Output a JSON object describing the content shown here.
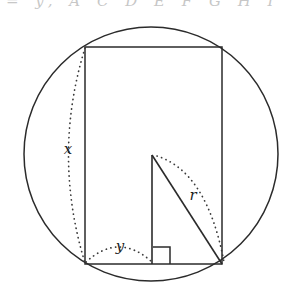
{
  "figure": {
    "caption_fragment": "= y, A C D E F G H I",
    "stroke_color": "#2b2b2b",
    "dotted_color": "#3a3a3a",
    "background_color": "#ffffff",
    "labels": [
      {
        "id": "x",
        "text": "x",
        "x": 68,
        "y": 149,
        "meaning": "rectangle-height"
      },
      {
        "id": "y",
        "text": "y",
        "x": 120,
        "y": 246,
        "meaning": "rectangle-base-half-span"
      },
      {
        "id": "r",
        "text": "r",
        "x": 193,
        "y": 195,
        "meaning": "circle-radius"
      }
    ],
    "circle": {
      "cx": 151,
      "cy": 154,
      "r": 127
    },
    "rectangle": {
      "left": 85,
      "top": 47,
      "right": 222,
      "bottom": 264
    },
    "triangle": {
      "apex": {
        "x": 152,
        "y": 155
      },
      "foot": {
        "x": 152,
        "y": 264
      },
      "corner": {
        "x": 222,
        "y": 264
      }
    },
    "right_angle_marker": {
      "x": 153,
      "y": 247,
      "size": 17
    },
    "dotted_arcs": [
      {
        "id": "x-arc",
        "from": {
          "x": 85,
          "y": 47
        },
        "to": {
          "x": 85,
          "y": 264
        },
        "control": {
          "x": 52,
          "y": 155
        }
      },
      {
        "id": "y-arc",
        "from": {
          "x": 86,
          "y": 262
        },
        "to": {
          "x": 152,
          "y": 262
        },
        "control": {
          "x": 119,
          "y": 232
        }
      },
      {
        "id": "r-arc",
        "from": {
          "x": 157,
          "y": 156
        },
        "to": {
          "x": 224,
          "y": 262
        },
        "control": {
          "x": 207,
          "y": 172
        }
      }
    ]
  }
}
